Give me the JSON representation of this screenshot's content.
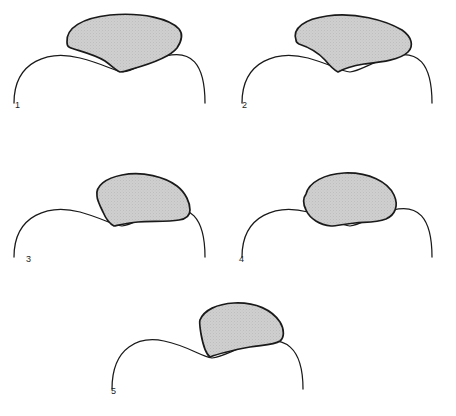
{
  "figure": {
    "background_color": "#ffffff",
    "outline_color": "#1a1a1a",
    "shape_fill_color": "#cccccc",
    "stipple_color": "#9a9a9a",
    "label_color": "#1c1c1c",
    "panel_count": 5
  },
  "panels": [
    {
      "id": "panel-1",
      "label": "1",
      "label_x": 15,
      "label_y": 108,
      "baseline_path": "M 14 103 C 14 60, 50 50, 80 58 C 104 64, 114 71, 123 72 C 133 71, 145 62, 166 56 C 190 50, 205 62, 205 103",
      "shape_path": "M 67 42 C 66 28, 82 18, 110 15 C 143 12, 170 19, 179 29 C 184 35, 181 42, 177 48 C 170 57, 150 64, 132 69 C 126 71, 122 72, 120 72 C 117 71, 112 66, 105 61 C 92 53, 74 50, 69 47 C 67 46, 67 44, 67 42 Z",
      "shape_note": "fan-shaped wedge, convex upper border, concave lower border meeting at a point"
    },
    {
      "id": "panel-2",
      "label": "2",
      "label_x": 242,
      "label_y": 108,
      "baseline_path": "M 242 103 C 242 60, 278 50, 308 58 C 330 64, 340 71, 350 72 C 360 71, 372 62, 393 56 C 417 50, 432 62, 432 103",
      "shape_path": "M 296 40 C 292 28, 305 19, 327 16 C 355 12, 385 20, 402 30 C 412 37, 414 46, 408 52 C 400 60, 381 62, 364 64 C 352 66, 343 69, 338 72 C 334 70, 330 66, 325 60 C 316 50, 305 46, 299 44 C 297 43, 296 41, 296 40 Z",
      "shape_note": "rounded lobe, bulging left end, tapering to a lower point on the left of the crest"
    },
    {
      "id": "panel-3",
      "label": "3",
      "label_x": 26,
      "label_y": 262,
      "baseline_path": "M 14 257 C 14 214, 50 204, 80 212 C 102 218, 112 225, 122 226 C 132 225, 144 216, 165 210 C 189 204, 205 216, 205 257",
      "shape_path": "M 97 196 C 95 186, 106 178, 122 175 C 143 171, 165 177, 177 186 C 186 193, 190 203, 190 210 C 190 216, 186 219, 179 220 C 168 222, 151 221, 138 222 C 127 223, 119 225, 114 226 C 110 224, 106 219, 103 212 C 99 204, 97 199, 97 196 Z",
      "shape_note": "tilted crescent sitting on the rising right slope of the wave"
    },
    {
      "id": "panel-4",
      "label": "4",
      "label_x": 239,
      "label_y": 262,
      "baseline_path": "M 242 257 C 242 214, 278 204, 308 212 C 330 218, 340 225, 350 226 C 360 225, 372 216, 393 210 C 417 204, 432 216, 432 257",
      "shape_path": "M 306 194 C 309 182, 325 174, 344 173 C 369 172, 388 182, 394 195 C 399 206, 395 215, 386 219 C 376 223, 364 222, 355 223 C 344 224, 337 226, 331 226 C 320 225, 310 219, 306 210 C 303 204, 303 198, 306 194 Z",
      "shape_note": "rounded kidney or bean shape with a shallow concavity on its lower right margin"
    },
    {
      "id": "panel-5",
      "label": "5",
      "label_x": 111,
      "label_y": 394,
      "baseline_path": "M 112 389 C 112 346, 140 336, 164 341 C 188 346, 200 356, 212 358 C 224 357, 238 347, 258 342 C 284 336, 303 346, 303 389",
      "shape_path": "M 200 320 C 204 310, 217 304, 234 303 C 256 302, 272 310, 280 322 C 285 330, 284 338, 280 341 C 274 345, 262 345, 250 347 C 234 350, 220 353, 210 357 C 206 354, 203 345, 201 334 C 200 327, 199 322, 200 320 Z",
      "shape_note": "steep narrow wedge, broad at top, tapering to a point in the wave trough"
    }
  ]
}
